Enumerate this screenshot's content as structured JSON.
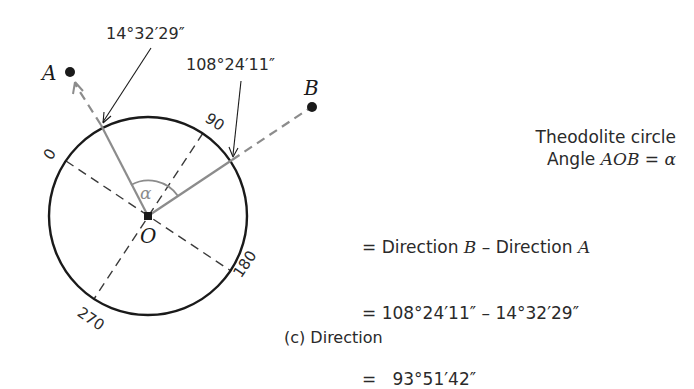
{
  "diagram": {
    "points": {
      "A": {
        "label": "A"
      },
      "B": {
        "label": "B"
      },
      "O": {
        "label": "O"
      }
    },
    "angle_label": "α",
    "direction_A_reading": "14°32′29″",
    "direction_B_reading": "108°24′11″",
    "circle_graduations": [
      "0",
      "90",
      "180",
      "270"
    ],
    "colors": {
      "ink": "#1a1a1a",
      "gray_line": "#8c8c8c",
      "dashed_line": "#3a3a3a"
    }
  },
  "explanation": {
    "title": "Theodolite circle",
    "line1_prefix": "Angle ",
    "line1_math": "AOB",
    "line1_suffix": " = ",
    "line1_alpha": "α",
    "line2_prefix": "= Direction ",
    "line2_B": "B",
    "line2_mid": " – Direction ",
    "line2_A": "A",
    "line3": "= 108°24′11″ – 14°32′29″",
    "line4": "=   93°51′42″"
  },
  "caption": "(c) Direction"
}
